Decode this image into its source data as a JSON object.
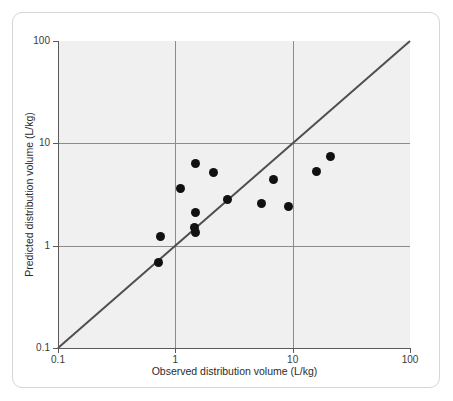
{
  "figure": {
    "border_color": "#d6d6d6",
    "plot_background": "#f0f0f0"
  },
  "chart_data": {
    "type": "scatter",
    "title": "",
    "subtitle": "",
    "xlabel": "Observed distribution volume (L/kg)",
    "ylabel": "Predicted distribution volume (L/kg)",
    "xscale": "log",
    "yscale": "log",
    "xlim": [
      0.1,
      100
    ],
    "ylim": [
      0.1,
      100
    ],
    "xticks": [
      "0.1",
      "1",
      "10",
      "100"
    ],
    "xtick_values": [
      0.1,
      1,
      10,
      100
    ],
    "yticks": [
      "0.1",
      "1",
      "10",
      "100"
    ],
    "ytick_values": [
      0.1,
      1,
      10,
      100
    ],
    "grid": true,
    "grid_color": "#8c8c8c",
    "legend": "none",
    "marker_color": "#111111",
    "marker_shape": "circle",
    "annotations": [
      {
        "name": "line-of-identity",
        "description": "diagonal line of identity y = x",
        "color": "#4f4f4f",
        "from": [
          0.1,
          0.1
        ],
        "to": [
          100,
          100
        ]
      }
    ],
    "series": [
      {
        "name": "Observed vs predicted distribution volume",
        "points": [
          {
            "x": 0.72,
            "y": 0.69
          },
          {
            "x": 0.75,
            "y": 1.22
          },
          {
            "x": 1.1,
            "y": 3.6
          },
          {
            "x": 1.45,
            "y": 1.5
          },
          {
            "x": 1.5,
            "y": 1.35
          },
          {
            "x": 1.5,
            "y": 2.1
          },
          {
            "x": 1.5,
            "y": 6.3
          },
          {
            "x": 2.1,
            "y": 5.2
          },
          {
            "x": 2.8,
            "y": 2.8
          },
          {
            "x": 5.4,
            "y": 2.6
          },
          {
            "x": 6.8,
            "y": 4.4
          },
          {
            "x": 9.2,
            "y": 2.4
          },
          {
            "x": 16.0,
            "y": 5.3
          },
          {
            "x": 21.0,
            "y": 7.5
          }
        ]
      }
    ]
  }
}
